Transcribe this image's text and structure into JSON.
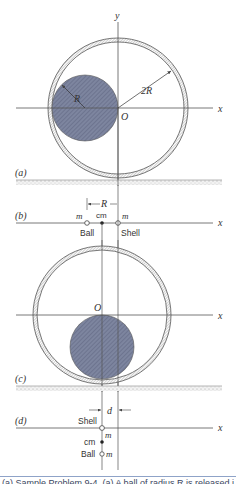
{
  "figure": {
    "colors": {
      "line": "#555555",
      "ball_fill": "#7d859f",
      "shell_hatch": "#8a8a8a",
      "ground": "#b8b8b8",
      "caption_rule": "#8fa3c8"
    },
    "panel_a": {
      "label": "(a)",
      "x_axis_label": "x",
      "y_axis_label": "y",
      "origin_label": "O",
      "ball_radius_label": "R",
      "shell_radius_label": "2R"
    },
    "panel_b": {
      "label": "(b)",
      "x_axis_label": "x",
      "distance_label": "R",
      "ball_mass_label": "m",
      "shell_mass_label": "m",
      "cm_label": "cm",
      "ball_label": "Ball",
      "shell_label": "Shell"
    },
    "panel_c": {
      "label": "(c)",
      "x_axis_label": "x",
      "origin_label": "O"
    },
    "panel_d": {
      "label": "(d)",
      "x_axis_label": "x",
      "distance_label": "d",
      "shell_label": "Shell",
      "shell_mass_label": "m",
      "cm_label": "cm",
      "ball_label": "Ball",
      "ball_mass_label": "m"
    },
    "caption": "(a)  Sample Problem 9-4. (a) A ball of radius R is released inside a shell"
  }
}
